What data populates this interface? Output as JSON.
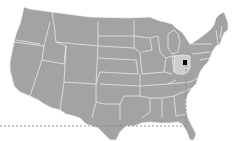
{
  "map": {
    "title": "United States",
    "highlighted_state": "Ohio",
    "colors": {
      "land": "#a3a3a3",
      "border": "#f2f2f2",
      "highlight": "#cdcdcd",
      "marker": "#000000",
      "guide_line": "#8a8a8a",
      "background": "#ffffff"
    },
    "marker": {
      "label": "Location marker",
      "x": 185,
      "y": 63
    },
    "guides": {
      "horizontal_y": 126,
      "vertical_x": 186
    }
  }
}
